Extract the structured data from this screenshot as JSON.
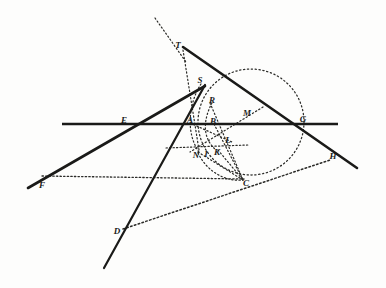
{
  "figure": {
    "kind": "geometry-diagram",
    "title": "",
    "background_color": "#fdfdfc",
    "ink_color": "#1a1a18",
    "width": 386,
    "height": 288
  },
  "points": [
    {
      "id": "T",
      "label": "T",
      "x": 178,
      "y": 45
    },
    {
      "id": "S",
      "label": "S",
      "x": 200,
      "y": 80
    },
    {
      "id": "R",
      "label": "R",
      "x": 212,
      "y": 100
    },
    {
      "id": "E",
      "label": "E",
      "x": 124,
      "y": 120
    },
    {
      "id": "A",
      "label": "A",
      "x": 190,
      "y": 120
    },
    {
      "id": "B",
      "label": "B",
      "x": 213,
      "y": 121
    },
    {
      "id": "M",
      "label": "M",
      "x": 247,
      "y": 113
    },
    {
      "id": "G",
      "label": "G",
      "x": 303,
      "y": 119
    },
    {
      "id": "L",
      "label": "L",
      "x": 228,
      "y": 140
    },
    {
      "id": "N",
      "label": "N",
      "x": 196,
      "y": 155
    },
    {
      "id": "I",
      "label": "I",
      "x": 206,
      "y": 154
    },
    {
      "id": "K",
      "label": "K",
      "x": 217,
      "y": 152
    },
    {
      "id": "H",
      "label": "H",
      "x": 333,
      "y": 156
    },
    {
      "id": "F",
      "label": "F",
      "x": 42,
      "y": 185
    },
    {
      "id": "C",
      "label": "C",
      "x": 246,
      "y": 183
    },
    {
      "id": "D",
      "label": "D",
      "x": 117,
      "y": 231
    }
  ],
  "segments": {
    "solid_thick": [
      {
        "name": "line-F-S",
        "x1": 28,
        "y1": 188,
        "x2": 205,
        "y2": 86
      },
      {
        "name": "line-T-H",
        "x1": 183,
        "y1": 47,
        "x2": 357,
        "y2": 168
      },
      {
        "name": "line-horizontal-E-G",
        "x1": 62,
        "y1": 124,
        "x2": 338,
        "y2": 124
      },
      {
        "name": "line-S-D-steep",
        "x1": 205,
        "y1": 85,
        "x2": 104,
        "y2": 268
      }
    ],
    "dotted": [
      {
        "name": "line-T-arc-upper",
        "x1": 155,
        "y1": 18,
        "x2": 186,
        "y2": 62
      },
      {
        "name": "line-T-N",
        "x1": 183,
        "y1": 50,
        "x2": 199,
        "y2": 150
      },
      {
        "name": "line-horizontal-N-L",
        "x1": 166,
        "y1": 148,
        "x2": 248,
        "y2": 145
      },
      {
        "name": "line-horizontal-F-C",
        "x1": 42,
        "y1": 176,
        "x2": 244,
        "y2": 179
      },
      {
        "name": "line-D-C-H",
        "x1": 123,
        "y1": 229,
        "x2": 330,
        "y2": 160
      },
      {
        "name": "line-M-N",
        "x1": 263,
        "y1": 107,
        "x2": 190,
        "y2": 152
      },
      {
        "name": "line-A-L",
        "x1": 190,
        "y1": 123,
        "x2": 232,
        "y2": 142
      },
      {
        "name": "line-R-C",
        "x1": 210,
        "y1": 103,
        "x2": 243,
        "y2": 180
      },
      {
        "name": "line-B-C",
        "x1": 214,
        "y1": 124,
        "x2": 243,
        "y2": 180
      },
      {
        "name": "line-N-C",
        "x1": 198,
        "y1": 152,
        "x2": 243,
        "y2": 180
      },
      {
        "name": "line-K-C",
        "x1": 218,
        "y1": 150,
        "x2": 243,
        "y2": 180
      }
    ],
    "dotted_circle": {
      "name": "circle-main",
      "cx": 251,
      "cy": 122,
      "r": 53
    },
    "dotted_arcs": [
      {
        "name": "arc-S-N-small",
        "d": "M 201,84 C 188,104 186,134 199,152"
      },
      {
        "name": "arc-R-K-inner",
        "d": "M 212,103 C 203,120 202,138 216,150"
      },
      {
        "name": "arc-N-C-lower",
        "d": "M 198,153 C 207,172 226,182 243,180"
      }
    ]
  }
}
